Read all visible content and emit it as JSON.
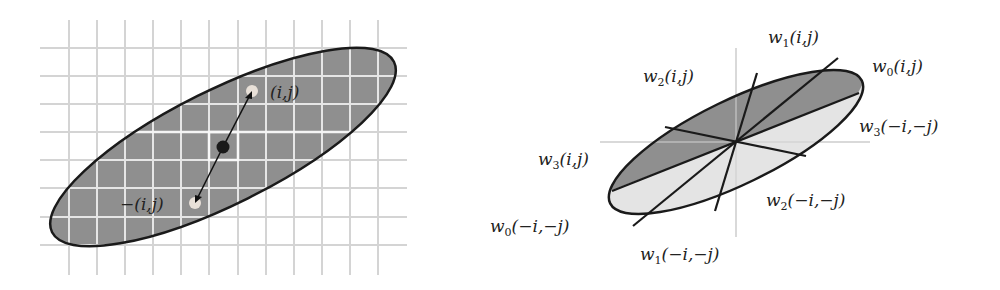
{
  "colors": {
    "background": "#ffffff",
    "grid_line": "#d4d4d4",
    "grid_line_inside": "#e6e6e6",
    "ellipse_fill_dark": "#8f8f8f",
    "ellipse_fill_light": "#e2e2e2",
    "outline": "#1a1a1a",
    "axis": "#cccccc"
  },
  "left_panel": {
    "description": "Elliptical neighborhood on a pixel grid with symmetric offsets",
    "center_point": {
      "x": 223,
      "y": 147
    },
    "point_pos": {
      "x": 252,
      "y": 91,
      "label": "(i,j)"
    },
    "point_neg": {
      "x": 195,
      "y": 203,
      "label": "−(i,j)"
    }
  },
  "right_panel": {
    "description": "Ellipse divided into sectors with weights",
    "labels": [
      {
        "id": "w1_pos",
        "w": "w",
        "sub": "1",
        "args": "(i,j)"
      },
      {
        "id": "w0_pos",
        "w": "w",
        "sub": "0",
        "args": "(i,j)"
      },
      {
        "id": "w2_pos",
        "w": "w",
        "sub": "2",
        "args": "(i,j)"
      },
      {
        "id": "w3_neg",
        "w": "w",
        "sub": "3",
        "args": "(−i,−j)"
      },
      {
        "id": "w3_pos",
        "w": "w",
        "sub": "3",
        "args": "(i,j)"
      },
      {
        "id": "w2_neg",
        "w": "w",
        "sub": "2",
        "args": "(−i,−j)"
      },
      {
        "id": "w0_neg",
        "w": "w",
        "sub": "0",
        "args": "(−i,−j)"
      },
      {
        "id": "w1_neg",
        "w": "w",
        "sub": "1",
        "args": "(−i,−j)"
      }
    ]
  }
}
